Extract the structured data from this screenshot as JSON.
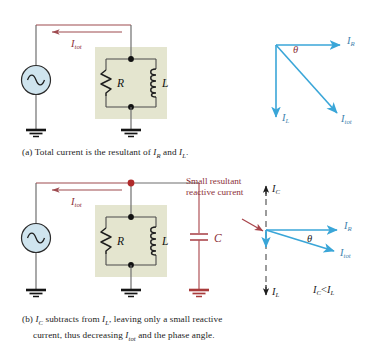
{
  "figure": {
    "panels": [
      {
        "id": "a",
        "caption_prefix": "(a)",
        "caption_text_1": "Total current is the resultant of ",
        "caption_i1": "I",
        "caption_i1_sub": "R",
        "caption_text_2": " and ",
        "caption_i2": "I",
        "caption_i2_sub": "L",
        "caption_text_3": ".",
        "circuit": {
          "source_label": "ac-source",
          "current_label": "I",
          "current_sub": "tot",
          "resistor_label": "R",
          "inductor_label": "L"
        },
        "phasor": {
          "angle_label": "θ",
          "vectors": [
            {
              "name": "I",
              "sub": "R",
              "direction": "right"
            },
            {
              "name": "I",
              "sub": "L",
              "direction": "down"
            },
            {
              "name": "I",
              "sub": "tot",
              "direction": "down-right"
            }
          ]
        }
      },
      {
        "id": "b",
        "caption_prefix": "(b)",
        "caption_ic": "I",
        "caption_ic_sub": "C",
        "caption_text_1": " subtracts from ",
        "caption_il": "I",
        "caption_il_sub": "L",
        "caption_text_2": ", leaving only a small reactive",
        "caption_line2_pre": "current, thus decreasing ",
        "caption_itot": "I",
        "caption_itot_sub": "tot",
        "caption_line2_post": " and the phase angle.",
        "annotation": "Small resultant reactive current",
        "annotation_lines": [
          "Small",
          "resultant",
          "reactive",
          "current"
        ],
        "circuit": {
          "current_label": "I",
          "current_sub": "tot",
          "resistor_label": "R",
          "inductor_label": "L",
          "capacitor_label": "C"
        },
        "phasor": {
          "angle_label": "θ",
          "axis_up_label": "I",
          "axis_up_sub": "C",
          "axis_down_label": "I",
          "axis_down_sub": "L",
          "relation": "I_C < I_L",
          "relation_left": "I",
          "relation_left_sub": "C",
          "relation_op": "<",
          "relation_right": "I",
          "relation_right_sub": "L",
          "vectors": [
            {
              "name": "I",
              "sub": "R",
              "direction": "right"
            },
            {
              "name": "I",
              "sub": "tot",
              "direction": "slight-down-right"
            }
          ]
        }
      }
    ],
    "colors": {
      "wire_gray": "#6f6f6f",
      "wire_red": "#9e4a4f",
      "accent_red": "#8c2f39",
      "phasor_blue": "#3aa6d8",
      "component_box": "#e4e5cf",
      "source_fill": "#cfe4ee",
      "node_black": "#111111",
      "node_red": "#b02a2a",
      "ground_black": "#141414",
      "text": "#1c1c1c"
    }
  }
}
